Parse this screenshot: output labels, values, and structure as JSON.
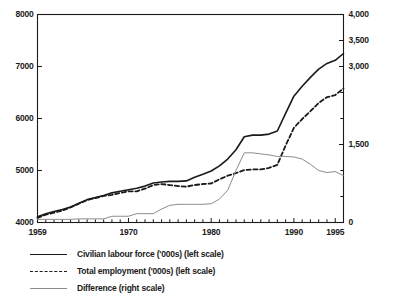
{
  "chart_data": {
    "type": "line",
    "title": "",
    "xlabel": "",
    "ylabel": "",
    "grid": false,
    "legend_position": "bottom-left",
    "x": [
      1959,
      1960,
      1961,
      1962,
      1963,
      1964,
      1965,
      1966,
      1967,
      1968,
      1969,
      1970,
      1971,
      1972,
      1973,
      1974,
      1975,
      1976,
      1977,
      1978,
      1979,
      1980,
      1981,
      1982,
      1983,
      1984,
      1985,
      1986,
      1987,
      1988,
      1989,
      1990,
      1991,
      1992,
      1993,
      1994,
      1995,
      1996
    ],
    "xlim": [
      1959,
      1996
    ],
    "xticks": [
      1959,
      1970,
      1980,
      1990,
      1995
    ],
    "xtick_labels": [
      "1959",
      "1970",
      "1980",
      "1990",
      "1995"
    ],
    "left_axis": {
      "label": "",
      "ylim": [
        4000,
        8000
      ],
      "ticks": [
        4000,
        5000,
        6000,
        7000,
        8000
      ],
      "tick_labels": [
        "4000",
        "5000",
        "6000",
        "7000",
        "8000"
      ]
    },
    "right_axis": {
      "label": "",
      "ylim": [
        0,
        4000
      ],
      "ticks": [
        0,
        1500,
        3000,
        3500,
        4000
      ],
      "tick_labels": [
        "0",
        "1,500",
        "3,000",
        "3,500",
        "4,000"
      ],
      "minor_ticks": [
        500,
        1000,
        2000,
        2500
      ]
    },
    "series": [
      {
        "name": "Civilian labour force ('000s) (left scale)",
        "axis": "left",
        "style": "solid",
        "color": "#1a1a1a",
        "width": 1.6,
        "values": [
          4110,
          4170,
          4210,
          4250,
          4300,
          4370,
          4440,
          4480,
          4520,
          4570,
          4600,
          4630,
          4660,
          4700,
          4760,
          4780,
          4790,
          4790,
          4800,
          4870,
          4930,
          4990,
          5090,
          5220,
          5400,
          5650,
          5680,
          5680,
          5700,
          5760,
          6100,
          6430,
          6620,
          6790,
          6950,
          7060,
          7120,
          7250
        ]
      },
      {
        "name": "Total employment ('000s) (left scale)",
        "axis": "left",
        "style": "dashed",
        "color": "#1a1a1a",
        "width": 1.8,
        "values": [
          4090,
          4150,
          4190,
          4230,
          4290,
          4360,
          4430,
          4470,
          4510,
          4530,
          4570,
          4600,
          4600,
          4650,
          4720,
          4740,
          4720,
          4700,
          4690,
          4720,
          4740,
          4750,
          4830,
          4900,
          4950,
          5010,
          5020,
          5020,
          5050,
          5110,
          5480,
          5820,
          5990,
          6140,
          6300,
          6410,
          6450,
          6580
        ]
      },
      {
        "name": "Difference (right scale)",
        "axis": "right",
        "style": "solid-thin",
        "color": "#8c8c8c",
        "width": 1.0,
        "values": [
          60,
          60,
          60,
          60,
          60,
          70,
          70,
          70,
          70,
          120,
          120,
          120,
          170,
          170,
          170,
          260,
          330,
          350,
          350,
          350,
          350,
          360,
          450,
          620,
          1000,
          1340,
          1340,
          1320,
          1300,
          1270,
          1270,
          1260,
          1220,
          1120,
          1000,
          960,
          980,
          900
        ]
      }
    ]
  },
  "legend": {
    "items": [
      {
        "label": "Civilian labour force ('000s) (left scale)",
        "swatch": "solid-line-swatch"
      },
      {
        "label": "Total employment ('000s) (left scale)",
        "swatch": "dashed-line-swatch"
      },
      {
        "label": "Difference (right scale)",
        "swatch": "thin-line-swatch"
      }
    ]
  }
}
